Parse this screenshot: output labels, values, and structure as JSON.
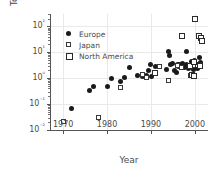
{
  "chart_data": {
    "type": "scatter",
    "title": "Human Blood, Milk, and Tissue",
    "xlabel": "Year",
    "ylabel": "Total lipid PBDE (ng/g)",
    "xlim": [
      1967,
      2003
    ],
    "ylim": [
      0.01,
      300
    ],
    "yscale": "log",
    "grid": true,
    "legend_position": "upper left",
    "xticks": [
      "1970",
      "1980",
      "1990",
      "2000"
    ],
    "xtick_values": [
      1970,
      1980,
      1990,
      2000
    ],
    "yticks": [
      "10²",
      "10¹",
      "10⁰",
      "10⁻¹",
      "10⁻²"
    ],
    "ytick_values": [
      100,
      10,
      1,
      0.1,
      0.01
    ],
    "series": [
      {
        "name": "Europe",
        "marker": "filled-circle",
        "color": "#1a1a1a",
        "points": [
          [
            1972,
            0.07
          ],
          [
            1976,
            0.33
          ],
          [
            1977,
            0.46
          ],
          [
            1980,
            0.48
          ],
          [
            1981,
            1.0
          ],
          [
            1983,
            0.75
          ],
          [
            1984,
            1.1
          ],
          [
            1985,
            2.6
          ],
          [
            1987,
            1.3
          ],
          [
            1988,
            1.2
          ],
          [
            1989,
            1.25
          ],
          [
            1989.5,
            2.0
          ],
          [
            1990,
            3.3
          ],
          [
            1990.2,
            1.15
          ],
          [
            1991,
            2.9
          ],
          [
            1993.6,
            2.2
          ],
          [
            1994,
            10.5
          ],
          [
            1994.2,
            7.5
          ],
          [
            1994.5,
            3.3
          ],
          [
            1995,
            3.6
          ],
          [
            1995.4,
            1.9
          ],
          [
            1995.8,
            1.6
          ],
          [
            1996,
            3.5
          ],
          [
            1996.3,
            2.9
          ],
          [
            1996.6,
            3.4
          ],
          [
            1997,
            3.1
          ],
          [
            1997.3,
            3.6
          ],
          [
            1997.6,
            2.6
          ],
          [
            1998,
            10.8
          ],
          [
            1998.2,
            3.4
          ],
          [
            1998.5,
            2.3
          ],
          [
            1999,
            3.0
          ],
          [
            1999.3,
            4.6
          ],
          [
            1999.6,
            2.1
          ],
          [
            2000,
            5.0
          ],
          [
            2000.3,
            3.1
          ],
          [
            2000.6,
            2.4
          ],
          [
            2001,
            6.3
          ],
          [
            2001.2,
            3.9
          ]
        ]
      },
      {
        "name": "Japan",
        "marker": "open-square",
        "color": "#3a3a3a",
        "points": [
          [
            1970,
            0.022
          ],
          [
            1978,
            0.031
          ],
          [
            1983,
            0.42
          ],
          [
            1988,
            1.45
          ],
          [
            1989,
            1.1
          ],
          [
            1992,
            2.8
          ],
          [
            1994,
            0.78
          ],
          [
            1996,
            3.0
          ],
          [
            1997,
            2.6
          ],
          [
            1999,
            1.25
          ],
          [
            1999.3,
            1.45
          ],
          [
            2000,
            3.2
          ]
        ]
      },
      {
        "name": "North America",
        "marker": "open-square-bold",
        "color": "#2a2a2a",
        "points": [
          [
            1991,
            1.6
          ],
          [
            1997,
            41
          ],
          [
            1999,
            2.9
          ],
          [
            1999.4,
            1.3
          ],
          [
            1999.7,
            1.2
          ],
          [
            2000,
            195
          ],
          [
            2001,
            43
          ],
          [
            2001.4,
            37
          ],
          [
            2001.6,
            27
          ],
          [
            2000.8,
            3.3
          ],
          [
            2001.2,
            3.0
          ],
          [
            1999.9,
            4.3
          ]
        ]
      }
    ]
  }
}
